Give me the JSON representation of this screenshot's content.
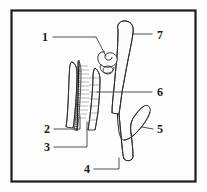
{
  "figure": {
    "type": "anatomical-line-drawing",
    "caption": "",
    "frame": {
      "border_color": "#1c1c1c",
      "background_color": "#fdfdfd",
      "x": 11,
      "y": 10,
      "width": 185,
      "height": 172
    },
    "style": {
      "outline_color": "#262626",
      "stipple_color": "#3a3a3a",
      "leader_color": "#3a3a3a",
      "label_color": "#1a1a1a"
    },
    "labels": [
      {
        "id": "label-1",
        "text": "1",
        "x": 48,
        "y": 40,
        "anchor": "end",
        "target_x": 106,
        "target_y": 56
      },
      {
        "id": "label-2",
        "text": "2",
        "x": 50,
        "y": 132,
        "anchor": "end",
        "target_x": 79,
        "target_y": 118
      },
      {
        "id": "label-3",
        "text": "3",
        "x": 50,
        "y": 150,
        "anchor": "end",
        "target_x": 86,
        "target_y": 122
      },
      {
        "id": "label-4",
        "text": "4",
        "x": 90,
        "y": 172,
        "anchor": "end",
        "target_x": 119,
        "target_y": 157
      },
      {
        "id": "label-5",
        "text": "5",
        "x": 155,
        "y": 132,
        "anchor": "start",
        "target_x": 140,
        "target_y": 128
      },
      {
        "id": "label-6",
        "text": "6",
        "x": 155,
        "y": 95,
        "anchor": "start",
        "target_x": 97,
        "target_y": 94
      },
      {
        "id": "label-7",
        "text": "7",
        "x": 156,
        "y": 38,
        "anchor": "start",
        "target_x": 133,
        "target_y": 33
      }
    ],
    "structures": [
      {
        "id": "structure-7-upper-limb",
        "name": "upper-stippled-limb",
        "label_ref": "7"
      },
      {
        "id": "structure-1-coil",
        "name": "upper-coil-loop",
        "label_ref": "1"
      },
      {
        "id": "structure-6-tube",
        "name": "coiled-tube",
        "label_ref": "6"
      },
      {
        "id": "structure-2-lobe",
        "name": "left-stippled-lobe",
        "label_ref": "2"
      },
      {
        "id": "structure-3-septum",
        "name": "hatched-septum",
        "label_ref": "3"
      },
      {
        "id": "structure-5-hook",
        "name": "lower-hook-limb",
        "label_ref": "5"
      },
      {
        "id": "structure-4-base",
        "name": "lower-base-tip",
        "label_ref": "4"
      }
    ]
  }
}
